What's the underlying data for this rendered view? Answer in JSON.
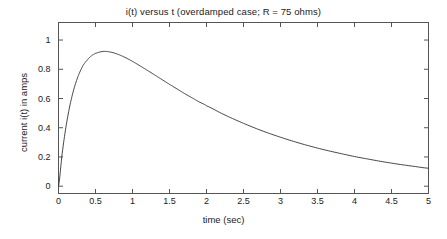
{
  "chart_data": {
    "type": "line",
    "title": "i(t) versus t (overdamped case; R = 75 ohms)",
    "xlabel": "time (sec)",
    "ylabel": "current i(t) in amps",
    "xlim": [
      0,
      5
    ],
    "ylim": [
      -0.05,
      1.12
    ],
    "grid": false,
    "legend": null,
    "xticks": [
      0,
      0.5,
      1,
      1.5,
      2,
      2.5,
      3,
      3.5,
      4,
      4.5,
      5
    ],
    "xtick_labels": [
      "0",
      "0.5",
      "1",
      "1.5",
      "2",
      "2.5",
      "3",
      "3.5",
      "4",
      "4.5",
      "5"
    ],
    "yticks": [
      0,
      0.2,
      0.4,
      0.6,
      0.8,
      1
    ],
    "ytick_labels": [
      "0",
      "0.2",
      "0.4",
      "0.6",
      "0.8",
      "1"
    ],
    "series": [
      {
        "name": "i(t)",
        "color": "#303030",
        "x": [
          0,
          0.05,
          0.1,
          0.15,
          0.2,
          0.25,
          0.3,
          0.35,
          0.37,
          0.4,
          0.45,
          0.5,
          0.6,
          0.7,
          0.8,
          0.9,
          1.0,
          1.1,
          1.2,
          1.3,
          1.4,
          1.5,
          1.6,
          1.7,
          1.8,
          1.9,
          2.0,
          2.2,
          2.4,
          2.6,
          2.8,
          3.0,
          3.2,
          3.4,
          3.6,
          3.8,
          4.0,
          4.2,
          4.4,
          4.6,
          4.8,
          5.0
        ],
        "y": [
          0.0,
          0.225,
          0.403,
          0.542,
          0.65,
          0.732,
          0.794,
          0.839,
          0.852,
          0.871,
          0.894,
          0.909,
          0.922,
          0.918,
          0.903,
          0.881,
          0.854,
          0.824,
          0.793,
          0.761,
          0.729,
          0.697,
          0.666,
          0.635,
          0.606,
          0.577,
          0.55,
          0.499,
          0.452,
          0.409,
          0.37,
          0.335,
          0.303,
          0.274,
          0.248,
          0.225,
          0.203,
          0.184,
          0.166,
          0.15,
          0.136,
          0.123
        ],
        "peak": {
          "x": 0.37,
          "y": 1.05
        },
        "endpoint": {
          "x": 5,
          "y": 0.11
        }
      }
    ]
  },
  "figure": {
    "background": "#ffffff",
    "axis_color": "#555555",
    "text_color": "#1a1a1a"
  }
}
